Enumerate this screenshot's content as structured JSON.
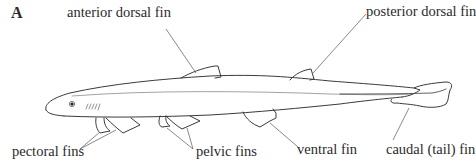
{
  "figure": {
    "panel_label": "A",
    "labels": {
      "anterior_dorsal_fin": "anterior dorsal fin",
      "posterior_dorsal_fin": "posterior dorsal fin",
      "pectoral_fins": "pectoral fins",
      "pelvic_fins": "pelvic fins",
      "ventral_fin": "ventral fin",
      "caudal_fin": "caudal (tail) fin"
    },
    "colors": {
      "outline": "#3a3a3a",
      "leader_line": "#6a6a6a",
      "background": "#ffffff"
    }
  }
}
